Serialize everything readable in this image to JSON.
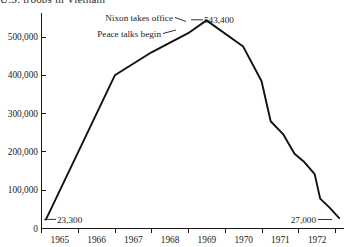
{
  "chart_data": {
    "type": "line",
    "title": "U.S. troops in Vietnam",
    "xlabel": "",
    "ylabel": "",
    "xlim": [
      1964.5,
      1972.75
    ],
    "ylim": [
      0,
      560000
    ],
    "grid": false,
    "legend": null,
    "y_ticks": [
      0,
      100000,
      200000,
      300000,
      400000,
      500000
    ],
    "y_tick_labels": [
      "0",
      "100,000",
      "200,000",
      "300,000",
      "400,000",
      "500,000"
    ],
    "x_ticks": [
      1964.5,
      1965.5,
      1966.5,
      1967.5,
      1968.5,
      1969.5,
      1970.5,
      1971.5,
      1972.5
    ],
    "x_tick_labels": [
      "1965",
      "1966",
      "1967",
      "1968",
      "1969",
      "1970",
      "1971",
      "1972"
    ],
    "series": [
      {
        "name": "U.S. troops in Vietnam",
        "x": [
          1964.62,
          1966.5,
          1967.5,
          1968.5,
          1969.0,
          1970.0,
          1970.5,
          1970.75,
          1971.1,
          1971.4,
          1971.65,
          1971.95,
          1972.1,
          1972.35,
          1972.62
        ],
        "values": [
          23300,
          400000,
          460000,
          510000,
          543400,
          475000,
          385000,
          280000,
          245000,
          195000,
          175000,
          142000,
          78000,
          55000,
          27000
        ]
      }
    ],
    "annotations": [
      {
        "name": "start-value",
        "label": "23,300",
        "x": 1964.62,
        "y": 23300,
        "leader": "right"
      },
      {
        "name": "peak-value",
        "label": "543,400",
        "x": 1969.0,
        "y": 543400,
        "leader": "right"
      },
      {
        "name": "nixon-takes-office",
        "label": "Nixon takes office",
        "x": 1969.0,
        "y": 543400,
        "leader": "left"
      },
      {
        "name": "peace-talks-begin",
        "label": "Peace talks begin",
        "x": 1968.45,
        "y": 508000,
        "leader": "left"
      },
      {
        "name": "end-value",
        "label": "27,000",
        "x": 1972.62,
        "y": 27000,
        "leader": "right"
      }
    ],
    "colors": {
      "line": "#111111",
      "axis": "#1a1a1a",
      "text": "#1a1a1a",
      "background": "#ffffff"
    }
  }
}
